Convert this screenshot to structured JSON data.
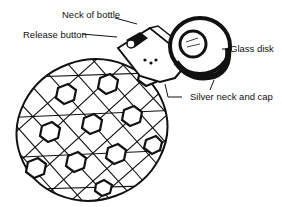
{
  "diagram": {
    "labels": [
      {
        "id": "neck",
        "text": "Neck of bottle"
      },
      {
        "id": "release",
        "text": "Release button"
      },
      {
        "id": "glass",
        "text": "Glass disk"
      },
      {
        "id": "silver",
        "text": "Silver neck and cap"
      }
    ],
    "colors": {
      "ink": "#111111",
      "background": "#ffffff"
    }
  }
}
